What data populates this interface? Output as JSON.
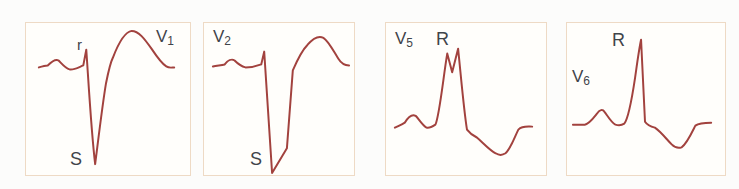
{
  "style": {
    "waveform_color": "#a2423e",
    "panel_border_color": "#eedac5",
    "panel_background": "#fffefb",
    "page_background": "#fcfcfb",
    "label_color": "#3f444a"
  },
  "panels": [
    {
      "name": "V1",
      "lead_letter": "V",
      "lead_sub": "1",
      "annotations": {
        "r_wave": "r",
        "s_wave": "S"
      },
      "view_box": "0 0 166 154",
      "trace_path": "M 13 45 C 16 44 19 43 22 43 C 26 39 30 36 33 38 C 36 41 40 46 44 47 C 48 48 53 45 58 43 L 61 27 C 63 55 66 110 70 143 C 72 128 77 85 81 61 C 83 51 85 41 88 35 C 93 22 100 9 107 8 C 114 8 120 16 127 26 C 131 32 137 41 142 44 C 145 46 148 45 150 45"
    },
    {
      "name": "V2",
      "lead_letter": "V",
      "lead_sub": "2",
      "annotations": {
        "s_wave": "S"
      },
      "view_box": "0 0 152 154",
      "trace_path": "M 9 44 C 13 43 17 43 21 42 C 24 38 28 36 31 38 C 34 41 38 44 42 45 C 47 45 53 44 58 42 L 61 29 L 69 152 L 84 127 L 90 48 C 93 41 99 28 105 22 C 111 15 117 13 121 15 C 126 18 131 28 136 36 C 139 41 143 43 147 43"
    },
    {
      "name": "V5",
      "lead_letter": "V",
      "lead_sub": "5",
      "annotations": {
        "r_wave": "R"
      },
      "view_box": "0 0 162 154",
      "trace_path": "M 9 106 C 13 104 16 103 19 101 C 22 96 26 92 30 94 C 33 97 37 104 41 106 C 44 107 47 105 50 103 C 54 95 58 55 62 31 L 67 50 L 73 26 C 76 55 79 90 82 108 C 85 112 88 114 92 116 C 98 121 105 129 111 132 C 114 134 118 134 121 132 C 126 128 130 116 134 108 C 138 104 143 105 148 105"
    },
    {
      "name": "V6",
      "lead_letter": "V",
      "lead_sub": "6",
      "annotations": {
        "r_wave": "R"
      },
      "view_box": "0 0 160 154",
      "trace_path": "M 6 103 L 18 103 C 23 102 27 96 31 91 C 33 88 36 87 38 90 C 41 94 45 101 49 103 C 52 104 55 104 58 102 C 62 97 66 75 69 55 C 71 41 73 26 75 17 L 79 100 C 81 103 85 105 89 106 C 95 110 101 118 106 123 C 109 126 113 127 116 126 C 121 123 126 112 130 104 C 134 101 140 101 146 101"
    }
  ]
}
